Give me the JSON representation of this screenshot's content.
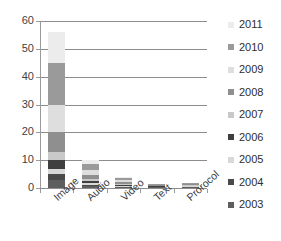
{
  "chart_data": {
    "type": "bar",
    "subtype": "stacked-bar",
    "title": "",
    "xlabel": "",
    "ylabel": "",
    "ylim": [
      0,
      60
    ],
    "ytick_step": 10,
    "ytick_labels": [
      "60",
      "50",
      "40",
      "30",
      "20",
      "10",
      "0"
    ],
    "ytick_values": [
      60,
      50,
      40,
      30,
      20,
      10,
      0
    ],
    "grid": true,
    "grid_axis": "y",
    "legend_position": "right",
    "categories": [
      "Image",
      "Audio",
      "Video",
      "Text",
      "Prorocol"
    ],
    "series": [
      {
        "name": "2003",
        "color": "#5e5e5e",
        "values": [
          3.0,
          0.6,
          0.3,
          0.2,
          0.2
        ]
      },
      {
        "name": "2004",
        "color": "#4a4a4a",
        "values": [
          2.0,
          0.5,
          0.2,
          0.1,
          0.2
        ]
      },
      {
        "name": "2005",
        "color": "#d8d8d8",
        "values": [
          2.0,
          0.6,
          0.3,
          0.1,
          0.2
        ]
      },
      {
        "name": "2006",
        "color": "#3f3f3f",
        "values": [
          3.0,
          0.7,
          0.3,
          0.2,
          0.2
        ]
      },
      {
        "name": "2007",
        "color": "#c9c9c9",
        "values": [
          3.0,
          0.9,
          0.4,
          0.2,
          0.2
        ]
      },
      {
        "name": "2008",
        "color": "#8f8f8f",
        "values": [
          7.0,
          1.5,
          0.6,
          0.2,
          0.3
        ]
      },
      {
        "name": "2009",
        "color": "#dedede",
        "values": [
          10.0,
          1.8,
          0.7,
          0.2,
          0.3
        ]
      },
      {
        "name": "2010",
        "color": "#9a9a9a",
        "values": [
          15.0,
          2.2,
          0.8,
          0.2,
          0.3
        ]
      },
      {
        "name": "2011",
        "color": "#ececec",
        "values": [
          11.0,
          1.2,
          0.4,
          0.1,
          0.1
        ]
      }
    ],
    "totals": [
      56.0,
      10.0,
      4.0,
      1.5,
      2.0
    ]
  },
  "legend": {
    "items": [
      {
        "label": "2011",
        "color": "#ececec"
      },
      {
        "label": "2010",
        "color": "#9a9a9a"
      },
      {
        "label": "2009",
        "color": "#dedede"
      },
      {
        "label": "2008",
        "color": "#8f8f8f"
      },
      {
        "label": "2007",
        "color": "#c9c9c9"
      },
      {
        "label": "2006",
        "color": "#3f3f3f"
      },
      {
        "label": "2005",
        "color": "#d8d8d8"
      },
      {
        "label": "2004",
        "color": "#4a4a4a"
      },
      {
        "label": "2003",
        "color": "#5e5e5e"
      }
    ]
  },
  "colors": {
    "background": "#ffffff",
    "gridline": "#8d8d8d",
    "axis": "#9a9a9a",
    "text": "#3b3b3b"
  }
}
